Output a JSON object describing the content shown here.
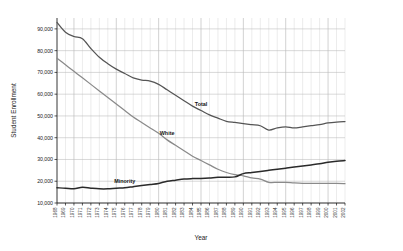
{
  "chart_data": {
    "type": "line",
    "title": "",
    "xlabel": "Year",
    "ylabel": "Student Enrollment",
    "grid": true,
    "legend_position": "inline-annotation",
    "ylim": [
      10000,
      95000
    ],
    "yticks": [
      10000,
      20000,
      30000,
      40000,
      50000,
      60000,
      70000,
      80000,
      90000
    ],
    "ytick_labels": [
      "10,000",
      "20,000",
      "30,000",
      "40,000",
      "50,000",
      "60,000",
      "70,000",
      "80,000",
      "90,000"
    ],
    "categories": [
      "1968",
      "1969",
      "1970",
      "1971",
      "1972",
      "1973",
      "1974",
      "1975",
      "1976",
      "1977",
      "1978",
      "1979",
      "1980",
      "1981",
      "1982",
      "1983",
      "1984",
      "1985",
      "1986",
      "1987",
      "1988",
      "1989",
      "1990",
      "1991",
      "1992",
      "1993",
      "1994",
      "1995",
      "1996",
      "1997",
      "1998",
      "1999",
      "2000",
      "2001",
      "2002"
    ],
    "series": [
      {
        "name": "Total",
        "color": "#555555",
        "label_x_index": 17,
        "values": [
          93000,
          88500,
          86500,
          85500,
          81000,
          77000,
          74000,
          71500,
          69500,
          67500,
          66500,
          66000,
          64500,
          62000,
          59500,
          57000,
          54500,
          52500,
          50500,
          49000,
          47500,
          47000,
          46500,
          46000,
          45500,
          43500,
          44500,
          45000,
          44500,
          45000,
          45500,
          46000,
          46800,
          47200,
          47400
        ]
      },
      {
        "name": "White",
        "color": "#8a8a8a",
        "label_x_index": 13,
        "values": [
          76500,
          73500,
          70500,
          67500,
          64500,
          61500,
          58500,
          55500,
          52500,
          49500,
          47000,
          44500,
          42000,
          39000,
          36500,
          34000,
          31500,
          29500,
          27500,
          25500,
          24000,
          23000,
          22500,
          21500,
          21000,
          19500,
          19500,
          19500,
          19200,
          19000,
          19000,
          19000,
          19000,
          19000,
          18900
        ]
      },
      {
        "name": "Minority",
        "color": "#2a2a2a",
        "label_x_index": 8,
        "values": [
          17000,
          16800,
          16500,
          17200,
          16800,
          16500,
          16500,
          16800,
          17000,
          17500,
          18000,
          18500,
          19000,
          20000,
          20500,
          21000,
          21200,
          21300,
          21500,
          21800,
          21800,
          22000,
          23500,
          24000,
          24500,
          25000,
          25500,
          26000,
          26500,
          27000,
          27500,
          28000,
          28700,
          29200,
          29500
        ]
      }
    ]
  }
}
